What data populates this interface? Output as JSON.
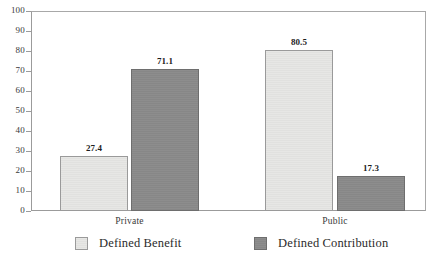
{
  "chart_data": {
    "type": "bar",
    "title": "",
    "subtitle": "",
    "xlabel": "",
    "ylabel": "",
    "categories": [
      "Private",
      "Public"
    ],
    "series": [
      {
        "name": "Defined Benefit",
        "color": "#e3e3e1",
        "values": [
          27.4,
          80.5
        ],
        "labels": [
          "27.4",
          "80.5"
        ]
      },
      {
        "name": "Defined Contribution",
        "color": "#8a8a8a",
        "values": [
          71.1,
          17.3
        ],
        "labels": [
          "71.1",
          "17.3"
        ]
      }
    ],
    "ylim": [
      0,
      100
    ],
    "ytick_step": 10,
    "ytick_labels": [
      "100",
      "90",
      "80",
      "70",
      "60",
      "50",
      "40",
      "30",
      "20",
      "10",
      "0"
    ],
    "grid": false,
    "legend_position": "bottom",
    "data_labels_shown": true
  },
  "axes": {
    "y_ticks": [
      {
        "value": 100,
        "label": "100"
      },
      {
        "value": 90,
        "label": "90"
      },
      {
        "value": 80,
        "label": "80"
      },
      {
        "value": 70,
        "label": "70"
      },
      {
        "value": 60,
        "label": "60"
      },
      {
        "value": 50,
        "label": "50"
      },
      {
        "value": 40,
        "label": "40"
      },
      {
        "value": 30,
        "label": "30"
      },
      {
        "value": 20,
        "label": "20"
      },
      {
        "value": 10,
        "label": "10"
      },
      {
        "value": 0,
        "label": "0"
      }
    ],
    "category_labels": [
      "Private",
      "Public"
    ]
  },
  "bars": [
    {
      "category": "Private",
      "series": "Defined Benefit",
      "value": 27.4,
      "label": "27.4",
      "tone": "light",
      "left": 29,
      "width": 68
    },
    {
      "category": "Private",
      "series": "Defined Contribution",
      "value": 71.1,
      "label": "71.1",
      "tone": "dark",
      "left": 100,
      "width": 68
    },
    {
      "category": "Public",
      "series": "Defined Benefit",
      "value": 80.5,
      "label": "80.5",
      "tone": "light",
      "left": 234,
      "width": 68
    },
    {
      "category": "Public",
      "series": "Defined Contribution",
      "value": 17.3,
      "label": "17.3",
      "tone": "dark",
      "left": 306,
      "width": 68
    }
  ],
  "legend": {
    "items": [
      {
        "label": "Defined Benefit",
        "tone": "light",
        "left": 75
      },
      {
        "label": "Defined Contribution",
        "tone": "dark",
        "left": 254
      }
    ]
  },
  "title_remnant": {
    "text": ""
  }
}
